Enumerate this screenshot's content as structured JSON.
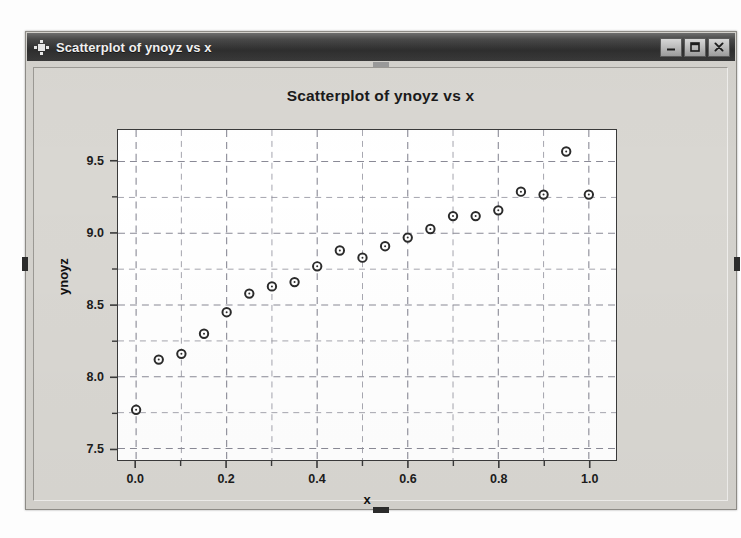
{
  "window": {
    "title": "Scatterplot of ynoyz vs x",
    "icon": "minitab-grid-icon",
    "buttons": [
      {
        "name": "minimize",
        "glyph": "minimize-icon"
      },
      {
        "name": "maximize",
        "glyph": "maximize-icon"
      },
      {
        "name": "close",
        "glyph": "close-icon"
      }
    ]
  },
  "colors": {
    "title_bar_dark": "#2e2e2e",
    "client_background": "#d9d7d2",
    "plot_background": "#ffffff",
    "grid": "#8a8a96",
    "marker_stroke": "#2b2b2b",
    "axis": "#3a3a3a"
  },
  "chart_data": {
    "type": "scatter",
    "title": "Scatterplot of ynoyz vs x",
    "xlabel": "x",
    "ylabel": "ynoyz",
    "xlim": [
      -0.04,
      1.06
    ],
    "ylim": [
      7.42,
      9.72
    ],
    "xticks": [
      "0.0",
      "0.2",
      "0.4",
      "0.6",
      "0.8",
      "1.0"
    ],
    "xtick_values": [
      0.0,
      0.2,
      0.4,
      0.6,
      0.8,
      1.0
    ],
    "yticks": [
      "7.5",
      "8.0",
      "8.5",
      "9.0",
      "9.5"
    ],
    "ytick_values": [
      7.5,
      8.0,
      8.5,
      9.0,
      9.5
    ],
    "minor_ticks": true,
    "grid": true,
    "grid_style": "dashed",
    "legend": "none",
    "marker": "open-circle",
    "series": [
      {
        "name": "ynoyz",
        "x": [
          0.0,
          0.05,
          0.1,
          0.15,
          0.2,
          0.25,
          0.3,
          0.35,
          0.4,
          0.45,
          0.5,
          0.55,
          0.6,
          0.65,
          0.7,
          0.75,
          0.8,
          0.85,
          0.9,
          0.95,
          1.0
        ],
        "y": [
          7.77,
          8.12,
          8.16,
          8.3,
          8.45,
          8.58,
          8.63,
          8.66,
          8.77,
          8.88,
          8.83,
          8.91,
          8.97,
          9.03,
          9.12,
          9.12,
          9.16,
          9.29,
          9.27,
          9.57,
          9.27
        ]
      }
    ]
  }
}
